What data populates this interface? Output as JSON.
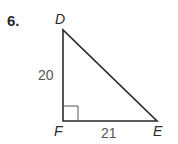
{
  "problem": {
    "number": "6."
  },
  "triangle": {
    "vertices": {
      "top": "D",
      "right_angle": "F",
      "bottom_right": "E"
    },
    "sides": {
      "DF": "20",
      "FE": "21"
    },
    "right_angle_at": "F",
    "colors": {
      "stroke": "#2a2a2a",
      "measure_text": "#555555"
    }
  }
}
